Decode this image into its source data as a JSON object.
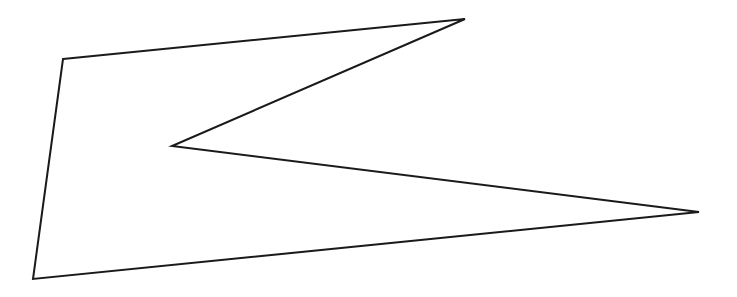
{
  "figure": {
    "type": "polygon",
    "stroke_color": "#1a1a1a",
    "fill_color": "none",
    "stroke_width": 2,
    "vertices": [
      {
        "x": 63,
        "y": 59
      },
      {
        "x": 465,
        "y": 19
      },
      {
        "x": 172,
        "y": 146
      },
      {
        "x": 699,
        "y": 212
      },
      {
        "x": 33,
        "y": 279
      }
    ]
  }
}
